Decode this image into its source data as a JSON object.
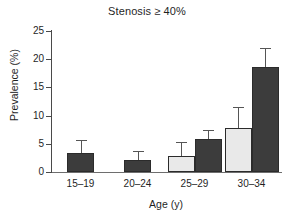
{
  "chart_data": {
    "type": "bar",
    "title": "Stenosis ≥ 40%",
    "xlabel": "Age (y)",
    "ylabel": "Prevalence (%)",
    "categories": [
      "15–19",
      "20–24",
      "25–29",
      "30–34"
    ],
    "ylim": [
      0,
      25
    ],
    "yticks": [
      0,
      5,
      10,
      15,
      20,
      25
    ],
    "ytick_labels": [
      "0",
      "5",
      "10",
      "15",
      "20",
      "25"
    ],
    "grid": false,
    "legend": "none",
    "series": [
      {
        "name": "light-series",
        "color": "#e9e9e9",
        "values": [
          null,
          null,
          2.9,
          7.8
        ],
        "error_upper": [
          null,
          null,
          5.4,
          11.5
        ]
      },
      {
        "name": "dark-series",
        "color": "#3c3c3c",
        "values": [
          3.4,
          2.2,
          5.8,
          18.6
        ],
        "error_upper": [
          5.7,
          3.7,
          7.5,
          21.9
        ]
      }
    ]
  },
  "colors": {
    "light_bar": "#e9e9e9",
    "dark_bar": "#3c3c3c",
    "bar_edge": "#2b2b2b",
    "axis": "#4a4a4a",
    "error_bar": "#555555",
    "background": "#ffffff"
  }
}
